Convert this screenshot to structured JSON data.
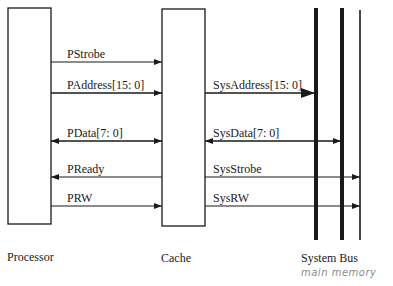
{
  "blocks": {
    "processor": {
      "label": "Processor"
    },
    "cache": {
      "label": "Cache"
    },
    "system_bus": {
      "label": "System Bus",
      "annotation": "main memory"
    }
  },
  "signals_processor_cache": [
    {
      "label": "PStrobe",
      "direction": "to-cache"
    },
    {
      "label": "PAddress[15: 0]",
      "direction": "to-cache"
    },
    {
      "label": "PData[7: 0]",
      "direction": "bidirectional"
    },
    {
      "label": "PReady",
      "direction": "to-processor"
    },
    {
      "label": "PRW",
      "direction": "to-cache"
    }
  ],
  "signals_cache_bus": [
    {
      "label": "SysAddress[15: 0]",
      "direction": "to-bus"
    },
    {
      "label": "SysData[7: 0]",
      "direction": "bidirectional"
    },
    {
      "label": "SysStrobe",
      "direction": "to-bus"
    },
    {
      "label": "SysRW",
      "direction": "to-bus"
    }
  ],
  "colors": {
    "line": "#1a1a1a",
    "annotation": "#8a8a8a"
  }
}
